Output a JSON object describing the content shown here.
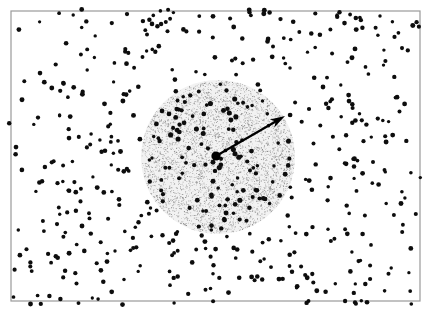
{
  "figure": {
    "type": "scatter-diagram",
    "title": "",
    "caption": "",
    "background_color": "#ffffff",
    "frame": {
      "name": "plot-frame",
      "x": 11,
      "y": 11,
      "width": 409,
      "height": 290,
      "stroke_color": "#9a9a9a",
      "stroke_width": 1.2,
      "fill": "#ffffff"
    },
    "stipple_region": {
      "name": "stippled-circle",
      "shape": "circle",
      "center_x": 218,
      "center_y": 157,
      "radius": 77,
      "fill_color": "#f2f2f2",
      "speckle_color": "#8c8c8c",
      "speckle_count": 5200,
      "speckle_radius": 0.55,
      "label": ""
    },
    "center_marker": {
      "name": "center-point",
      "x": 216,
      "y": 156,
      "radius": 4.6,
      "color": "#000000",
      "label": ""
    },
    "radius_arrow": {
      "name": "radius-arrow",
      "x1": 216,
      "y1": 156,
      "x2": 285,
      "y2": 116,
      "stroke_color": "#000000",
      "stroke_width": 2.2,
      "head_length": 15,
      "head_width": 9,
      "label": ""
    },
    "points": {
      "name": "scatter-points",
      "color": "#0d0d0d",
      "radius": 2.0,
      "count_outside": 430,
      "count_inside": 128,
      "seed": 20240517,
      "description": "Randomly distributed black dots across the framed field, with an equally dense subset inside the stippled circle."
    }
  },
  "chart_data": {
    "type": "scatter",
    "title": "",
    "xlabel": "",
    "ylabel": "",
    "xlim": [
      11,
      420
    ],
    "ylim": [
      11,
      301
    ],
    "grid": false,
    "legend": null,
    "annotations": [
      {
        "kind": "circle",
        "center": [
          218,
          157
        ],
        "radius": 77,
        "style": "stippled"
      },
      {
        "kind": "arrow",
        "from": [
          216,
          156
        ],
        "to": [
          285,
          116
        ],
        "meaning": "radius"
      },
      {
        "kind": "point",
        "at": [
          216,
          156
        ],
        "meaning": "center"
      }
    ]
  }
}
